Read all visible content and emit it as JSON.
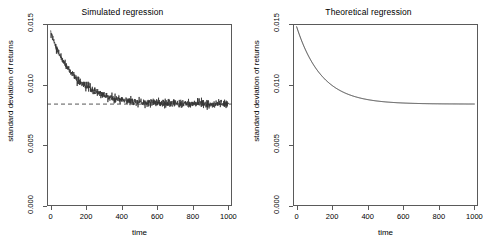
{
  "figure": {
    "width": 491,
    "height": 252,
    "background": "#ffffff",
    "foreground": "#000000",
    "axis_color": "#5a5a5a",
    "panel_count": 2
  },
  "axis": {
    "xlabel": "time",
    "ylabel": "standard deviation of returns",
    "xticks": [
      0,
      200,
      400,
      600,
      800,
      1000
    ],
    "xticklabels": [
      "0",
      "200",
      "400",
      "600",
      "800",
      "1000"
    ],
    "yticks": [
      0.0,
      0.005,
      0.01,
      0.015
    ],
    "yticklabels": [
      "0.000",
      "0.005",
      "0.010",
      "0.015"
    ],
    "xlim": [
      -20,
      1020
    ],
    "ylim": [
      0.0,
      0.015
    ]
  },
  "chart_data": [
    {
      "type": "scatter",
      "panel": "left",
      "title": "Simulated regression",
      "xlabel": "time",
      "ylabel": "standard deviation of returns",
      "xlim": [
        -20,
        1020
      ],
      "ylim": [
        0.0,
        0.015
      ],
      "xticks": [
        0,
        200,
        400,
        600,
        800,
        1000
      ],
      "yticks": [
        0.0,
        0.005,
        0.01,
        0.015
      ],
      "grid": false,
      "legend": null,
      "series": [
        {
          "name": "simulated standard deviation",
          "style": "noisy-points",
          "marker": "point",
          "color": "#333333",
          "description": "exponentially decaying noisy series from 0.0142 at t=0 converging to 0.0084 with residual noise of about +/-0.0003",
          "model": "y = 0.00840 + 0.00585 * exp(-t / 145)",
          "noise_sd": 0.00016,
          "y_start": 0.0142,
          "y_end": 0.0084,
          "decay_constant": 145,
          "n_points": 1000,
          "x": [
            0,
            25,
            50,
            75,
            100,
            150,
            200,
            250,
            300,
            350,
            400,
            450,
            500,
            600,
            700,
            800,
            900,
            1000
          ],
          "values": [
            0.0142,
            0.01332,
            0.0125,
            0.01188,
            0.01135,
            0.01043,
            0.00983,
            0.00942,
            0.00912,
            0.00893,
            0.00879,
            0.00869,
            0.00861,
            0.00851,
            0.00846,
            0.00843,
            0.00842,
            0.00841
          ]
        },
        {
          "name": "long-run asymptote",
          "style": "dashed-line",
          "color": "#444444",
          "dash": "4 3",
          "y": 0.0084,
          "description": "horizontal dashed reference line at the long-run standard deviation"
        }
      ]
    },
    {
      "type": "line",
      "panel": "right",
      "title": "Theoretical regression",
      "xlabel": "time",
      "ylabel": "standard deviation of returns",
      "xlim": [
        -20,
        1020
      ],
      "ylim": [
        0.0,
        0.015
      ],
      "xticks": [
        0,
        200,
        400,
        600,
        800,
        1000
      ],
      "yticks": [
        0.0,
        0.005,
        0.01,
        0.015
      ],
      "grid": false,
      "legend": null,
      "series": [
        {
          "name": "theoretical standard deviation",
          "style": "solid-line",
          "color": "#333333",
          "description": "smooth exponential decay from 0.0148 at t=0 converging to 0.0084",
          "model": "y = 0.00840 + 0.00640 * exp(-t / 140)",
          "y_start": 0.0148,
          "y_end": 0.0084,
          "decay_constant": 140,
          "x": [
            0,
            25,
            50,
            75,
            100,
            150,
            200,
            250,
            300,
            350,
            400,
            450,
            500,
            600,
            700,
            800,
            900,
            1000
          ],
          "values": [
            0.0148,
            0.01368,
            0.01275,
            0.01196,
            0.01131,
            0.01028,
            0.00955,
            0.00903,
            0.00877,
            0.00862,
            0.00853,
            0.00848,
            0.00845,
            0.00842,
            0.00841,
            0.0084,
            0.0084,
            0.0084
          ]
        }
      ]
    }
  ]
}
